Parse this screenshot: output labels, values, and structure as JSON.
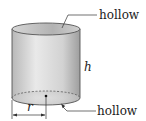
{
  "diagram": {
    "labels": {
      "top_hollow": "hollow",
      "bottom_hollow": "hollow",
      "height": "h",
      "radius": "r"
    },
    "colors": {
      "body_light": "#e6e6e6",
      "body_dark": "#a9a9a9",
      "inner_top": "#bdbdbd",
      "outline": "#555555",
      "leader": "#333333"
    }
  }
}
